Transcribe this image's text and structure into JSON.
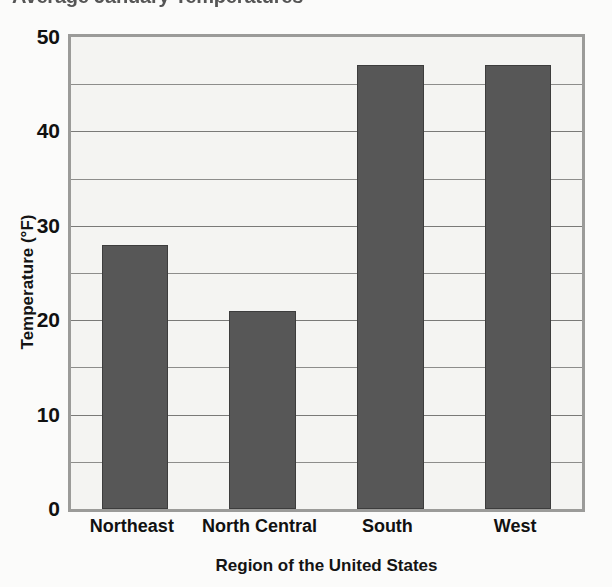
{
  "chart_data": {
    "type": "bar",
    "title": "Average January Temperatures",
    "xlabel": "Region of the United States",
    "ylabel": "Temperature (°F)",
    "categories": [
      "Northeast",
      "North Central",
      "South",
      "West"
    ],
    "values": [
      28,
      21,
      47,
      47
    ],
    "ylim": [
      0,
      50
    ],
    "ytick_labels": [
      "50",
      "40",
      "30",
      "20",
      "10",
      "0"
    ],
    "ytick_values": [
      50,
      40,
      30,
      20,
      10,
      0
    ],
    "gridline_values": [
      50,
      45,
      40,
      35,
      30,
      25,
      20,
      15,
      10,
      5,
      0
    ],
    "grid": true,
    "grid_axis": "y",
    "legend": false,
    "bar_color": "#575757",
    "bar_edge_color": "#3d3d3d",
    "plot_background": "#f4f4f2",
    "plot_border_color": "#9b9b99",
    "gridline_color": "#8d8d8b",
    "text_color": "#111111",
    "title_clipped": true
  }
}
